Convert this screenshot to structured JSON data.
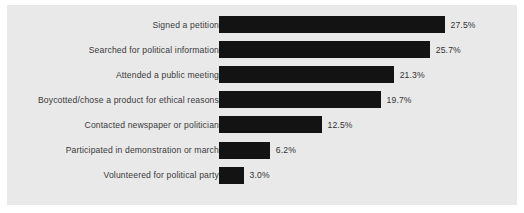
{
  "chart_data": {
    "type": "bar",
    "orientation": "horizontal",
    "title": "",
    "subtitle": "",
    "xlabel": "",
    "ylabel": "",
    "grid": false,
    "legend": false,
    "legend_position": "none",
    "xlim": [
      0,
      30
    ],
    "value_suffix": "%",
    "bar_color": "#131313",
    "panel_color": "#e9e9e9",
    "label_color": "#3a3a3a",
    "value_color": "#333333",
    "categories": [
      "Signed a petition",
      "Searched for political information",
      "Attended a public meeting",
      "Boycotted/chose a product for ethical reasons",
      "Contacted newspaper or politician",
      "Participated in demonstration or march",
      "Volunteered for political party"
    ],
    "values": [
      27.5,
      25.7,
      21.3,
      19.7,
      12.5,
      6.2,
      3.0
    ],
    "value_labels": [
      "27.5%",
      "25.7%",
      "21.3%",
      "19.7%",
      "12.5%",
      "6.2%",
      "3.0%"
    ],
    "bars": [
      {
        "label": "Signed a petition",
        "value": 27.5,
        "value_label": "27.5%"
      },
      {
        "label": "Searched for political information",
        "value": 25.7,
        "value_label": "25.7%"
      },
      {
        "label": "Attended a public meeting",
        "value": 21.3,
        "value_label": "21.3%"
      },
      {
        "label": "Boycotted/chose a product for ethical reasons",
        "value": 19.7,
        "value_label": "19.7%"
      },
      {
        "label": "Contacted newspaper or politician",
        "value": 12.5,
        "value_label": "12.5%"
      },
      {
        "label": "Participated in demonstration or march",
        "value": 6.2,
        "value_label": "6.2%"
      },
      {
        "label": "Volunteered for political party",
        "value": 3.0,
        "value_label": "3.0%"
      }
    ]
  }
}
